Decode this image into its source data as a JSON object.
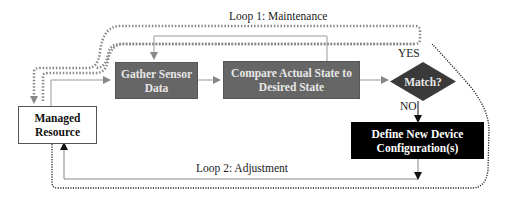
{
  "diagram": {
    "type": "flowchart",
    "loops": {
      "maintenance": {
        "label": "Loop 1: Maintenance",
        "style": "dotted-gray"
      },
      "adjustment": {
        "label": "Loop 2: Adjustment",
        "style": "solid-gray"
      }
    },
    "nodes": {
      "managed_resource": {
        "label": "Managed Resource",
        "shape": "rectangle",
        "fill": "#ffffff"
      },
      "gather": {
        "label": "Gather Sensor Data",
        "shape": "rectangle",
        "fill": "#666666"
      },
      "compare": {
        "label": "Compare Actual State to Desired State",
        "shape": "rectangle",
        "fill": "#666666"
      },
      "match": {
        "label": "Match?",
        "shape": "diamond",
        "fill": "#3a3a3a"
      },
      "define": {
        "label": "Define New Device Configuration(s)",
        "shape": "rectangle",
        "fill": "#000000"
      }
    },
    "edge_labels": {
      "yes": "YES",
      "no": "NO"
    },
    "colors": {
      "wire": "#999999",
      "dotted_gray": "#888888",
      "dotted_black": "#222222"
    }
  }
}
